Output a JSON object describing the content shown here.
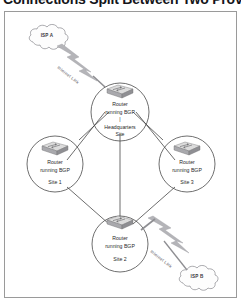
{
  "heading": {
    "text": "Connections Split Between Two Providers"
  },
  "figure": {
    "clouds": [
      {
        "id": "isp-a",
        "label": "ISP A"
      },
      {
        "id": "isp-b",
        "label": "ISP B"
      }
    ],
    "internet_links": [
      {
        "id": "internet-link-top",
        "label": "Internet Link"
      },
      {
        "id": "internet-link-bottom",
        "label": "Internet Link"
      }
    ],
    "nodes": [
      {
        "id": "headquarters",
        "line1": "Router",
        "line2": "running BGP",
        "site": "Headquarters",
        "site2": "Site"
      },
      {
        "id": "site-1",
        "line1": "Router",
        "line2": "running BGP",
        "site": "Site 1",
        "site2": ""
      },
      {
        "id": "site-3",
        "line1": "Router",
        "line2": "running BGP",
        "site": "Site 3",
        "site2": ""
      },
      {
        "id": "site-2",
        "line1": "Router",
        "line2": "running BGP",
        "site": "Site 2",
        "site2": ""
      }
    ],
    "colors": {
      "frame_border": "#9a9a9a",
      "circle_stroke": "#4a4a4a",
      "cloud_stroke": "#8d8d93",
      "link_line": "#3c3c3c",
      "bolt_fill": "#b4b4b8",
      "router_top": "#dcdcdc",
      "router_side": "#8f8f93",
      "text": "#2a2a2a"
    }
  }
}
